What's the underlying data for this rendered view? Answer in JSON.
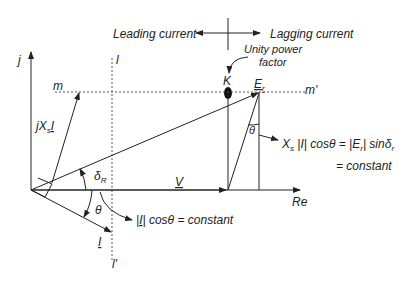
{
  "diagram": {
    "type": "phasor-diagram",
    "axes": {
      "vertical": "j",
      "horizontal": "Re"
    },
    "top_labels": {
      "leading": "Leading current",
      "lagging": "Lagging current"
    },
    "unity_pf": {
      "line1": "Unity power",
      "line2": "factor",
      "point": "K"
    },
    "loci": {
      "horizontal_start": "m",
      "horizontal_end": "m'",
      "vertical_start": "l",
      "vertical_end": "l'"
    },
    "phasors": {
      "voltage": "V",
      "current": "I",
      "reactance_drop_prefix": "jX",
      "reactance_drop_sub": "s",
      "reactance_drop_suffix": "I",
      "emf": "E",
      "emf_sub": "r"
    },
    "angles": {
      "delta": "δ",
      "delta_sub": "R",
      "theta": "θ",
      "theta2": "θ"
    },
    "equations": {
      "current_const_a": "|",
      "current_const_I": "I",
      "current_const_b": "| cosθ = constant",
      "power_line1_pre": "X",
      "power_line1_sub": "s",
      "power_line1_mid": " |I| cosθ = |E",
      "power_line1_sub2": "r",
      "power_line1_post": "| sinδ",
      "power_line1_sub3": "r",
      "power_line2": "= constant"
    },
    "colors": {
      "line": "#222222",
      "dashed": "#555555",
      "background": "#ffffff"
    }
  }
}
